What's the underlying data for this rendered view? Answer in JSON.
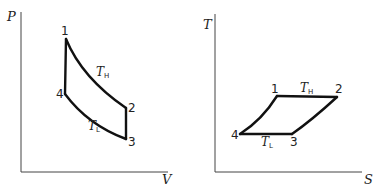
{
  "pv_diagram": {
    "y_axis_label": "P",
    "x_axis_label": "V",
    "points": [
      {
        "id": "1",
        "label": "1"
      },
      {
        "id": "2",
        "label": "2"
      },
      {
        "id": "3",
        "label": "3"
      },
      {
        "id": "4",
        "label": "4"
      }
    ],
    "isotherm_high": {
      "symbol": "T",
      "subscript": "H"
    },
    "isotherm_low": {
      "symbol": "T",
      "subscript": "L"
    }
  },
  "ts_diagram": {
    "y_axis_label": "T",
    "x_axis_label": "S",
    "points": [
      {
        "id": "1",
        "label": "1"
      },
      {
        "id": "2",
        "label": "2"
      },
      {
        "id": "3",
        "label": "3"
      },
      {
        "id": "4",
        "label": "4"
      }
    ],
    "isotherm_high": {
      "symbol": "T",
      "subscript": "H"
    },
    "isotherm_low": {
      "symbol": "T",
      "subscript": "L"
    }
  },
  "colors": {
    "line": "#111111",
    "axis": "#444444",
    "background": "#ffffff"
  }
}
